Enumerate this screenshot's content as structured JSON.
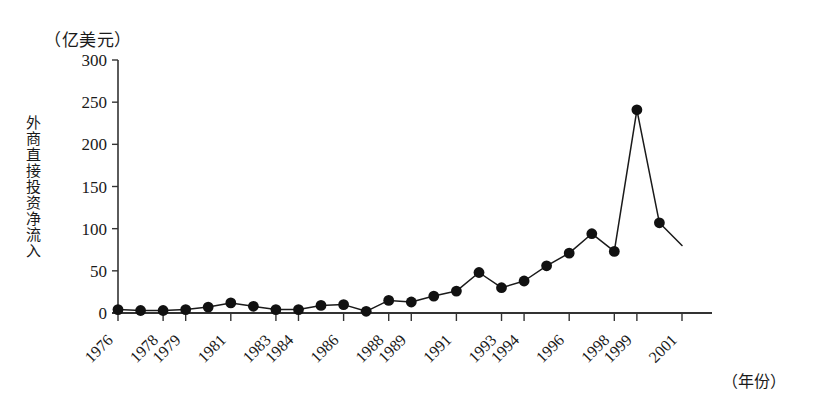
{
  "chart_data": {
    "type": "line",
    "title": "",
    "unit_label": "（亿美元）",
    "ylabel": "外商直接投资净流入",
    "xlabel": "（年份）",
    "grid": false,
    "legend": null,
    "marker": "filled-circle",
    "ylim": [
      0,
      300
    ],
    "yticks": [
      0,
      50,
      100,
      150,
      200,
      250,
      300
    ],
    "ytick_labels": [
      "0",
      "50",
      "100",
      "150",
      "200",
      "250",
      "300"
    ],
    "xlim": [
      1976,
      2001
    ],
    "xtick_labels": [
      "1976",
      "1978",
      "1979",
      "1981",
      "1983",
      "1984",
      "1986",
      "1988",
      "1989",
      "1991",
      "1993",
      "1994",
      "1996",
      "1998",
      "1999",
      "2001"
    ],
    "x": [
      1976,
      1977,
      1978,
      1979,
      1980,
      1981,
      1982,
      1983,
      1984,
      1985,
      1986,
      1987,
      1988,
      1989,
      1990,
      1991,
      1992,
      1993,
      1994,
      1995,
      1996,
      1997,
      1998,
      1999,
      2000,
      2001
    ],
    "values": [
      4,
      3,
      3,
      4,
      7,
      12,
      8,
      4,
      4,
      9,
      10,
      2,
      15,
      13,
      20,
      26,
      48,
      30,
      38,
      56,
      71,
      94,
      73,
      241,
      107,
      80
    ],
    "series": [
      {
        "name": "外商直接投资净流入",
        "values": [
          4,
          3,
          3,
          4,
          7,
          12,
          8,
          4,
          4,
          9,
          10,
          2,
          15,
          13,
          20,
          26,
          48,
          30,
          38,
          56,
          71,
          94,
          73,
          241,
          107,
          80
        ]
      }
    ],
    "annotations": [
      "峰值 1999 年约 241 亿美元",
      "1993 年局部峰值约 48 亿美元"
    ],
    "colors": {
      "line": "#1a1a1a",
      "marker": "#111111",
      "axis": "#333333",
      "background": "#ffffff"
    }
  }
}
